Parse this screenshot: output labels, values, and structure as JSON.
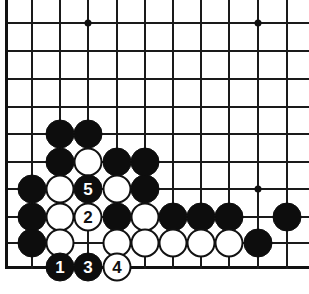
{
  "figure": {
    "name": "go-board-diagram",
    "type": "go-board-problem",
    "background_color": "#ffffff",
    "line_color": "#1a1a1a",
    "black_color": "#0d0d0d",
    "white_color": "#ffffff"
  },
  "board": {
    "columns_px": [
      6,
      32,
      60,
      88,
      117,
      145,
      173,
      201,
      229,
      258,
      287
    ],
    "rows_px": [
      23,
      51,
      79,
      107,
      134,
      162,
      189,
      217,
      243,
      267
    ],
    "spacing_px": 28,
    "left_edge_x": 6,
    "bottom_edge_y": 267,
    "star_points": [
      {
        "x": 88,
        "y": 23
      },
      {
        "x": 258,
        "y": 23
      },
      {
        "x": 258,
        "y": 189
      }
    ]
  },
  "stones": [
    {
      "x": 60,
      "y": 134,
      "color": "black",
      "label": ""
    },
    {
      "x": 88,
      "y": 134,
      "color": "black",
      "label": ""
    },
    {
      "x": 60,
      "y": 162,
      "color": "black",
      "label": ""
    },
    {
      "x": 88,
      "y": 162,
      "color": "white",
      "label": ""
    },
    {
      "x": 117,
      "y": 162,
      "color": "black",
      "label": ""
    },
    {
      "x": 145,
      "y": 162,
      "color": "black",
      "label": ""
    },
    {
      "x": 32,
      "y": 189,
      "color": "black",
      "label": ""
    },
    {
      "x": 60,
      "y": 189,
      "color": "white",
      "label": ""
    },
    {
      "x": 88,
      "y": 189,
      "color": "black",
      "label": "5"
    },
    {
      "x": 117,
      "y": 189,
      "color": "white",
      "label": ""
    },
    {
      "x": 145,
      "y": 189,
      "color": "black",
      "label": ""
    },
    {
      "x": 32,
      "y": 217,
      "color": "black",
      "label": ""
    },
    {
      "x": 60,
      "y": 217,
      "color": "white",
      "label": ""
    },
    {
      "x": 88,
      "y": 217,
      "color": "white",
      "label": "2"
    },
    {
      "x": 117,
      "y": 217,
      "color": "black",
      "label": ""
    },
    {
      "x": 145,
      "y": 217,
      "color": "white",
      "label": ""
    },
    {
      "x": 173,
      "y": 217,
      "color": "black",
      "label": ""
    },
    {
      "x": 201,
      "y": 217,
      "color": "black",
      "label": ""
    },
    {
      "x": 229,
      "y": 217,
      "color": "black",
      "label": ""
    },
    {
      "x": 287,
      "y": 217,
      "color": "black",
      "label": ""
    },
    {
      "x": 32,
      "y": 243,
      "color": "black",
      "label": ""
    },
    {
      "x": 60,
      "y": 243,
      "color": "white",
      "label": ""
    },
    {
      "x": 117,
      "y": 243,
      "color": "white",
      "label": ""
    },
    {
      "x": 145,
      "y": 243,
      "color": "white",
      "label": ""
    },
    {
      "x": 173,
      "y": 243,
      "color": "white",
      "label": ""
    },
    {
      "x": 201,
      "y": 243,
      "color": "white",
      "label": ""
    },
    {
      "x": 229,
      "y": 243,
      "color": "white",
      "label": ""
    },
    {
      "x": 258,
      "y": 243,
      "color": "black",
      "label": ""
    },
    {
      "x": 60,
      "y": 267,
      "color": "black",
      "label": "1"
    },
    {
      "x": 88,
      "y": 267,
      "color": "black",
      "label": "3"
    },
    {
      "x": 117,
      "y": 267,
      "color": "white",
      "label": "4"
    }
  ],
  "move_sequence": [
    {
      "number": "1",
      "color": "black"
    },
    {
      "number": "2",
      "color": "white"
    },
    {
      "number": "3",
      "color": "black"
    },
    {
      "number": "4",
      "color": "white"
    },
    {
      "number": "5",
      "color": "black"
    }
  ]
}
